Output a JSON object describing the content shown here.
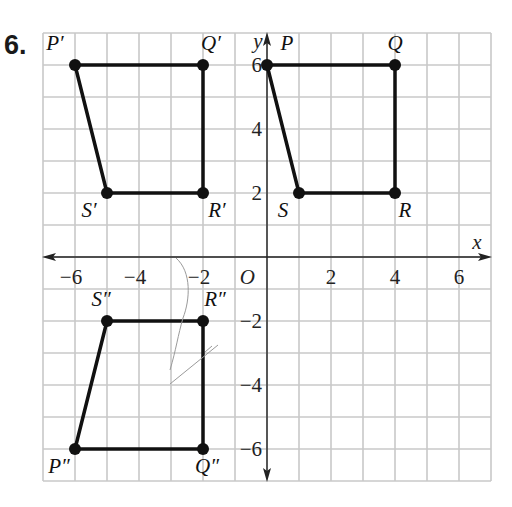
{
  "problem": {
    "number": "6."
  },
  "grid": {
    "xmin": -7,
    "xmax": 7,
    "ymin": -7,
    "ymax": 7,
    "origin_px": [
      267,
      257
    ],
    "cell_px": 32,
    "line_color": "#c8c8c8",
    "axis_color": "#222222"
  },
  "axes": {
    "x_label": "x",
    "y_label": "y",
    "origin_label": "O",
    "x_ticks": [
      {
        "value": -6,
        "label": "−6"
      },
      {
        "value": -4,
        "label": "−4"
      },
      {
        "value": -2,
        "label": "−2"
      },
      {
        "value": 2,
        "label": "2"
      },
      {
        "value": 4,
        "label": "4"
      },
      {
        "value": 6,
        "label": "6"
      }
    ],
    "y_ticks": [
      {
        "value": 6,
        "label": "6"
      },
      {
        "value": 4,
        "label": "4"
      },
      {
        "value": 2,
        "label": "2"
      },
      {
        "value": -2,
        "label": "−2"
      },
      {
        "value": -4,
        "label": "−4"
      },
      {
        "value": -6,
        "label": "−6"
      }
    ]
  },
  "figures": [
    {
      "name": "PQRS",
      "vertices": [
        {
          "label": "P",
          "x": 0,
          "y": 6
        },
        {
          "label": "Q",
          "x": 4,
          "y": 6
        },
        {
          "label": "R",
          "x": 4,
          "y": 2
        },
        {
          "label": "S",
          "x": 1,
          "y": 2
        }
      ]
    },
    {
      "name": "P'Q'R'S'",
      "vertices": [
        {
          "label": "P′",
          "x": -6,
          "y": 6
        },
        {
          "label": "Q′",
          "x": -2,
          "y": 6
        },
        {
          "label": "R′",
          "x": -2,
          "y": 2
        },
        {
          "label": "S′",
          "x": -5,
          "y": 2
        }
      ]
    },
    {
      "name": "P''Q''R''S''",
      "vertices": [
        {
          "label": "P″",
          "x": -6,
          "y": -6
        },
        {
          "label": "Q″",
          "x": -2,
          "y": -6
        },
        {
          "label": "R″",
          "x": -2,
          "y": -2
        },
        {
          "label": "S″",
          "x": -5,
          "y": -2
        }
      ]
    }
  ],
  "chart_data": {
    "type": "scatter",
    "title": "",
    "xlabel": "x",
    "ylabel": "y",
    "xlim": [
      -7,
      7
    ],
    "ylim": [
      -7,
      7
    ],
    "grid": true,
    "series": [
      {
        "name": "PQRS",
        "points": [
          [
            0,
            6
          ],
          [
            4,
            6
          ],
          [
            4,
            2
          ],
          [
            1,
            2
          ]
        ],
        "labels": [
          "P",
          "Q",
          "R",
          "S"
        ],
        "closed": true
      },
      {
        "name": "P'Q'R'S'",
        "points": [
          [
            -6,
            6
          ],
          [
            -2,
            6
          ],
          [
            -2,
            2
          ],
          [
            -5,
            2
          ]
        ],
        "labels": [
          "P'",
          "Q'",
          "R'",
          "S'"
        ],
        "closed": true
      },
      {
        "name": "P''Q''R''S''",
        "points": [
          [
            -6,
            -6
          ],
          [
            -2,
            -6
          ],
          [
            -2,
            -2
          ],
          [
            -5,
            -2
          ]
        ],
        "labels": [
          "P''",
          "Q''",
          "R''",
          "S''"
        ],
        "closed": true
      }
    ]
  }
}
